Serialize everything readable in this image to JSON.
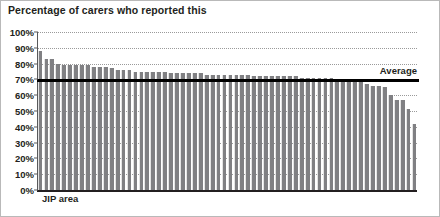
{
  "chart_data": {
    "type": "bar",
    "title": "Percentage of carers who reported this",
    "xlabel": "JIP area",
    "ylabel": "",
    "ylim": [
      0,
      100
    ],
    "yticks": [
      100,
      90,
      80,
      70,
      60,
      50,
      40,
      30,
      20,
      10,
      0
    ],
    "ytick_labels": [
      "100%",
      "90%",
      "80%",
      "70%",
      "60%",
      "50%",
      "40%",
      "30%",
      "20%",
      "10%",
      "0%"
    ],
    "grid": "horizontal dotted gridlines at every 10%",
    "legend": "none",
    "bar_color": "#808083",
    "annotations": [
      {
        "label": "Average",
        "type": "reference-line",
        "value": 70,
        "color": "#000000",
        "position": "right"
      }
    ],
    "categories": [
      "1",
      "2",
      "3",
      "4",
      "5",
      "6",
      "7",
      "8",
      "9",
      "10",
      "11",
      "12",
      "13",
      "14",
      "15",
      "16",
      "17",
      "18",
      "19",
      "20",
      "21",
      "22",
      "23",
      "24",
      "25",
      "26",
      "27",
      "28",
      "29",
      "30",
      "31",
      "32",
      "33",
      "34",
      "35",
      "36",
      "37",
      "38",
      "39",
      "40",
      "41",
      "42",
      "43",
      "44",
      "45",
      "46",
      "47",
      "48",
      "49",
      "50",
      "51",
      "52",
      "53",
      "54",
      "55",
      "56",
      "57",
      "58",
      "59",
      "60",
      "61",
      "62",
      "63",
      "64"
    ],
    "values": [
      88,
      83,
      83,
      80,
      79,
      79,
      79,
      79,
      79,
      78,
      78,
      78,
      77,
      76,
      76,
      76,
      75,
      75,
      75,
      75,
      75,
      75,
      74,
      74,
      74,
      74,
      74,
      74,
      73,
      73,
      73,
      73,
      73,
      73,
      73,
      73,
      72,
      72,
      72,
      72,
      72,
      72,
      72,
      72,
      71,
      71,
      71,
      71,
      71,
      71,
      70,
      70,
      70,
      70,
      69,
      67,
      66,
      66,
      65,
      60,
      57,
      57,
      51,
      42
    ]
  }
}
